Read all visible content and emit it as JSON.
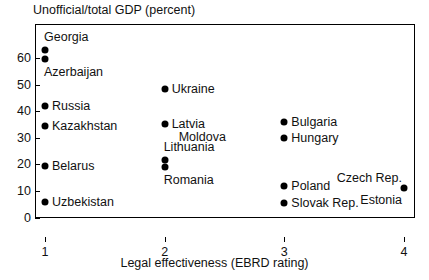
{
  "chart_data": {
    "type": "scatter",
    "title": "Unofficial/total GDP (percent)",
    "xlabel": "Legal effectiveness (EBRD rating)",
    "ylabel": "Unofficial/total GDP (percent)",
    "xlim": [
      0.7,
      4.2
    ],
    "ylim": [
      0,
      70
    ],
    "xticks": [
      1,
      2,
      3,
      4
    ],
    "xtick_labels": [
      "1",
      "2",
      "3",
      "4"
    ],
    "yticks": [
      0,
      10,
      20,
      30,
      40,
      50,
      60
    ],
    "ytick_labels": [
      "0",
      "10",
      "20",
      "30",
      "40",
      "50",
      "60"
    ],
    "grid": false,
    "legend": "none",
    "points": [
      {
        "label": "Georgia",
        "x": 1,
        "y": 63.0,
        "label_pos": "above"
      },
      {
        "label": "Azerbaijan",
        "x": 1,
        "y": 59.5,
        "label_pos": "below"
      },
      {
        "label": "Russia",
        "x": 1,
        "y": 42.0,
        "label_pos": "right"
      },
      {
        "label": "Kazakhstan",
        "x": 1,
        "y": 34.5,
        "label_pos": "right"
      },
      {
        "label": "Belarus",
        "x": 1,
        "y": 19.5,
        "label_pos": "right"
      },
      {
        "label": "Uzbekistan",
        "x": 1,
        "y": 6.0,
        "label_pos": "right"
      },
      {
        "label": "Ukraine",
        "x": 2,
        "y": 48.5,
        "label_pos": "right"
      },
      {
        "label": "Latvia",
        "x": 2,
        "y": 35.0,
        "label_pos": "right"
      },
      {
        "label": "Moldova",
        "x": 2,
        "y": 35.0,
        "label_pos": "below-right"
      },
      {
        "label": "Lithuania",
        "x": 2,
        "y": 21.5,
        "label_pos": "above"
      },
      {
        "label": "Romania",
        "x": 2,
        "y": 19.0,
        "label_pos": "below"
      },
      {
        "label": "Bulgaria",
        "x": 3,
        "y": 36.0,
        "label_pos": "right"
      },
      {
        "label": "Hungary",
        "x": 3,
        "y": 30.0,
        "label_pos": "right"
      },
      {
        "label": "Poland",
        "x": 3,
        "y": 12.0,
        "label_pos": "right"
      },
      {
        "label": "Slovak Rep.",
        "x": 3,
        "y": 5.5,
        "label_pos": "right"
      },
      {
        "label": "Czech Rep.",
        "x": 4,
        "y": 11.0,
        "label_pos": "above-left"
      },
      {
        "label": "Estonia",
        "x": 4,
        "y": 11.0,
        "label_pos": "below-left"
      }
    ],
    "marker_color": "#000000",
    "frame_color": "#000000",
    "background_color": "#ffffff"
  }
}
